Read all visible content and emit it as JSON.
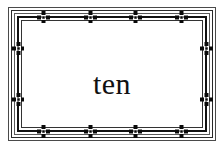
{
  "card": {
    "label": "decorative-bordered-card",
    "background_color": "#ffffff",
    "ink_color": "#111111"
  },
  "caption": {
    "text": "ten"
  },
  "frame": {
    "rules": [
      {
        "name": "rule-outer",
        "weight": 1,
        "color": "#4a4a4a"
      },
      {
        "name": "rule-second",
        "weight": 1,
        "color": "#2a2a2a"
      },
      {
        "name": "rule-third",
        "weight": 1,
        "color": "#5a5a5a"
      },
      {
        "name": "rule-heavy-band",
        "weight": 2,
        "color": "#111111"
      },
      {
        "name": "rule-inner",
        "weight": 1,
        "color": "#333333"
      }
    ],
    "ornament_glyph": "cross-lozenge-ornament",
    "ornament_color": "#0a0a0a",
    "ornaments": [
      {
        "edge": "top",
        "x": 35,
        "y": 10
      },
      {
        "edge": "top",
        "x": 82,
        "y": 10
      },
      {
        "edge": "top",
        "x": 127,
        "y": 10
      },
      {
        "edge": "top",
        "x": 173,
        "y": 10
      },
      {
        "edge": "bottom",
        "x": 35,
        "y": 124
      },
      {
        "edge": "bottom",
        "x": 82,
        "y": 124
      },
      {
        "edge": "bottom",
        "x": 127,
        "y": 124
      },
      {
        "edge": "bottom",
        "x": 173,
        "y": 124
      },
      {
        "edge": "left",
        "x": 10,
        "y": 41
      },
      {
        "edge": "left",
        "x": 10,
        "y": 92
      },
      {
        "edge": "right",
        "x": 198,
        "y": 41
      },
      {
        "edge": "right",
        "x": 198,
        "y": 92
      }
    ]
  }
}
